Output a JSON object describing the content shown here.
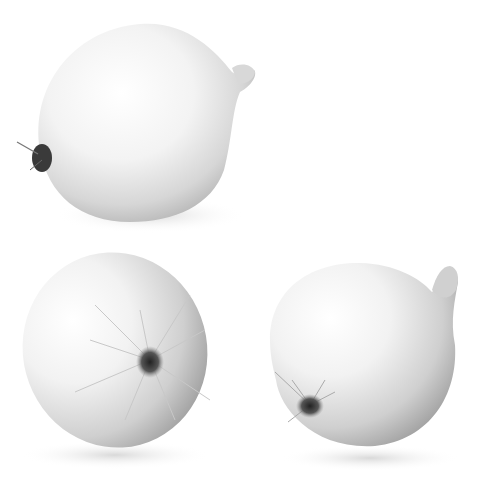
{
  "image": {
    "subject": "Three white onions on a white background",
    "background_color": "#ffffff"
  },
  "onions": [
    {
      "id": "top-onion",
      "position": "top-left",
      "orientation": "side view, root on left, stem on upper right"
    },
    {
      "id": "bottom-left-onion",
      "position": "bottom-left",
      "orientation": "root end facing viewer"
    },
    {
      "id": "bottom-right-onion",
      "position": "bottom-right",
      "orientation": "root lower-left, stem upper-right"
    }
  ],
  "colors": {
    "skin_highlight": "#ffffff",
    "skin_mid": "#e6e6e6",
    "skin_shadow": "#a8a8a8",
    "root": "#3a3a3a",
    "root_hair": "#bdbdbd",
    "shadow": "#d8d8d8"
  }
}
